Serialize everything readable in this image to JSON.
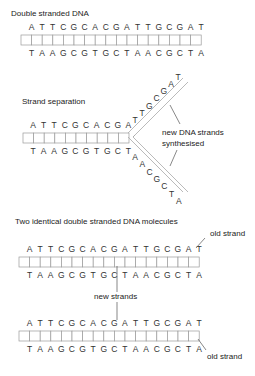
{
  "section1": {
    "title": "Double stranded DNA",
    "top_strand": [
      "A",
      "T",
      "T",
      "C",
      "G",
      "C",
      "A",
      "C",
      "G",
      "A",
      "T",
      "T",
      "G",
      "C",
      "G",
      "A",
      "T"
    ],
    "bottom_strand": [
      "T",
      "A",
      "A",
      "G",
      "C",
      "G",
      "T",
      "G",
      "C",
      "T",
      "A",
      "A",
      "C",
      "G",
      "C",
      "T",
      "A"
    ]
  },
  "section2": {
    "title": "Strand separation",
    "paired_top": [
      "A",
      "T",
      "T",
      "C",
      "G",
      "C",
      "A",
      "C",
      "G",
      "A"
    ],
    "paired_bottom": [
      "T",
      "A",
      "A",
      "G",
      "C",
      "G",
      "T",
      "G",
      "C",
      "T"
    ],
    "upper_arm": [
      "T",
      "T",
      "G",
      "C",
      "G",
      "A",
      "T"
    ],
    "lower_arm": [
      "A",
      "A",
      "C",
      "G",
      "C",
      "T",
      "A"
    ],
    "annotation_line1": "new DNA strands",
    "annotation_line2": "synthesised"
  },
  "section3": {
    "title": "Two identical double stranded DNA molecules",
    "molecule1_top": [
      "A",
      "T",
      "T",
      "C",
      "G",
      "C",
      "A",
      "C",
      "G",
      "A",
      "T",
      "T",
      "G",
      "C",
      "G",
      "A",
      "T"
    ],
    "molecule1_bottom": [
      "T",
      "A",
      "A",
      "G",
      "C",
      "G",
      "T",
      "G",
      "C",
      "T",
      "A",
      "A",
      "C",
      "G",
      "C",
      "T",
      "A"
    ],
    "molecule2_top": [
      "A",
      "T",
      "T",
      "C",
      "G",
      "C",
      "A",
      "C",
      "G",
      "A",
      "T",
      "T",
      "G",
      "C",
      "G",
      "A",
      "T"
    ],
    "molecule2_bottom": [
      "T",
      "A",
      "A",
      "G",
      "C",
      "G",
      "T",
      "G",
      "C",
      "T",
      "A",
      "A",
      "C",
      "G",
      "C",
      "T",
      "A"
    ],
    "old_strand_label_top": "old strand",
    "new_strands_label": "new strands",
    "old_strand_label_bottom": "old strand"
  }
}
